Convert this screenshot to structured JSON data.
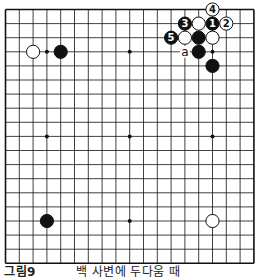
{
  "board": {
    "size": 19,
    "origin": {
      "x": 5.5,
      "y": 9.5
    },
    "spacing": {
      "x": 13.8,
      "y": 14.1
    },
    "hoshi": [
      [
        3,
        3
      ],
      [
        9,
        3
      ],
      [
        15,
        3
      ],
      [
        3,
        9
      ],
      [
        9,
        9
      ],
      [
        15,
        9
      ],
      [
        3,
        15
      ],
      [
        9,
        15
      ],
      [
        15,
        15
      ]
    ],
    "stones": [
      {
        "col": 2,
        "row": 3,
        "color": "white",
        "label": ""
      },
      {
        "col": 4,
        "row": 3,
        "color": "black",
        "label": ""
      },
      {
        "col": 3,
        "row": 15,
        "color": "black",
        "label": ""
      },
      {
        "col": 15,
        "row": 15,
        "color": "white",
        "label": ""
      },
      {
        "col": 15,
        "row": 0,
        "color": "white",
        "label": "4"
      },
      {
        "col": 15,
        "row": 1,
        "color": "black",
        "label": "1"
      },
      {
        "col": 16,
        "row": 1,
        "color": "white",
        "label": "2"
      },
      {
        "col": 13,
        "row": 1,
        "color": "black",
        "label": "3"
      },
      {
        "col": 14,
        "row": 1,
        "color": "white",
        "label": ""
      },
      {
        "col": 12,
        "row": 2,
        "color": "black",
        "label": "5"
      },
      {
        "col": 13,
        "row": 2,
        "color": "white",
        "label": ""
      },
      {
        "col": 14,
        "row": 2,
        "color": "black",
        "label": ""
      },
      {
        "col": 15,
        "row": 2,
        "color": "white",
        "label": ""
      },
      {
        "col": 14,
        "row": 3,
        "color": "black",
        "label": ""
      },
      {
        "col": 15,
        "row": 4,
        "color": "black",
        "label": ""
      }
    ],
    "marks": [
      {
        "col": 13,
        "row": 3,
        "label": "a"
      }
    ]
  },
  "caption": {
    "figure": "그림9",
    "text": "백 사변에 두다움 때"
  }
}
